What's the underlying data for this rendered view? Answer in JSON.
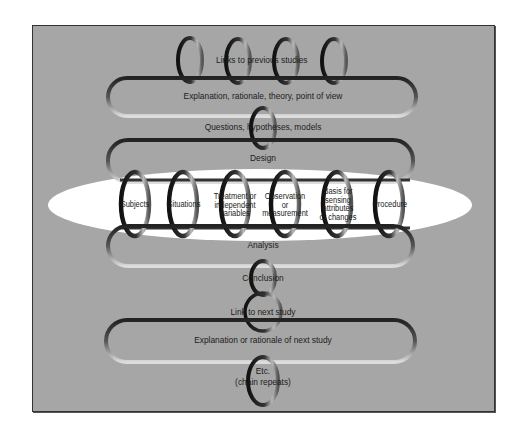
{
  "diagram": {
    "type": "chain-of-reasoning",
    "colors": {
      "panel": "#a6a6a6",
      "highlight_ellipse": "#ffffff",
      "ring_dark": "#1a1a1a",
      "ring_light": "#d9d9d9",
      "text": "#1c1c1c"
    },
    "nodes": {
      "links_previous": "Links to previous studies",
      "explanation": "Explanation, rationale, theory, point of view",
      "questions": "Questions, hypotheses, models",
      "design": "Design",
      "design_components": [
        {
          "label": "Subjects"
        },
        {
          "label": "Situations"
        },
        {
          "label": "Treatment or independent variables"
        },
        {
          "label": "Observation or measurement"
        },
        {
          "label": "Basis for sensing attributes or changes"
        },
        {
          "label": "Procedure"
        }
      ],
      "analysis": "Analysis",
      "conclusion": "Conclusion",
      "link_next": "Link to next study",
      "explanation_next": "Explanation or rationale of next study",
      "etc": "Etc.",
      "etc_sub": "(chain repeats)"
    },
    "design_lines": {
      "c2": [
        "Treatment or",
        "independent",
        "variables"
      ],
      "c3": [
        "Observation",
        "or",
        "measurement"
      ],
      "c4": [
        "Basis for",
        "sensing",
        "attributes",
        "or changes"
      ]
    }
  }
}
